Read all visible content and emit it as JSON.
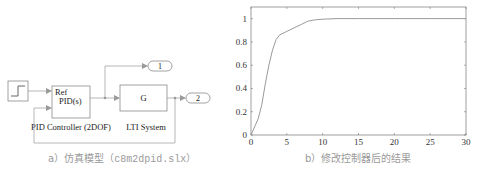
{
  "diagram": {
    "blocks": {
      "step": {
        "name": "Step"
      },
      "pid": {
        "port_label": "Ref",
        "inner_label": "PID(s)",
        "caption": "PID Controller (2DOF)"
      },
      "lti": {
        "inner_label": "G",
        "caption": "LTI System"
      },
      "outport1": {
        "label": "1"
      },
      "outport2": {
        "label": "2"
      }
    },
    "caption": {
      "prefix": "a）仿真模型（",
      "file": "c8m2dpid.slx",
      "suffix": "）"
    }
  },
  "chart_data": {
    "type": "line",
    "title": "",
    "xlabel": "",
    "ylabel": "",
    "xlim": [
      0,
      30
    ],
    "ylim": [
      0,
      1.1
    ],
    "xticks": [
      "0",
      "5",
      "10",
      "15",
      "20",
      "25",
      "30"
    ],
    "yticks": [
      "0",
      "0.2",
      "0.4",
      "0.6",
      "0.8",
      "1"
    ],
    "grid": false,
    "legend": null,
    "series": [
      {
        "name": "output",
        "x": [
          0,
          0.5,
          1,
          1.5,
          2,
          2.5,
          3,
          3.5,
          4,
          5,
          6,
          7,
          8,
          9,
          10,
          12,
          15,
          20,
          25,
          30
        ],
        "y": [
          0,
          0.07,
          0.14,
          0.26,
          0.44,
          0.6,
          0.73,
          0.82,
          0.86,
          0.89,
          0.92,
          0.95,
          0.98,
          0.99,
          0.995,
          1.0,
          1.0,
          1.0,
          1.0,
          1.0
        ]
      }
    ],
    "caption": "b）修改控制器后的结果"
  }
}
